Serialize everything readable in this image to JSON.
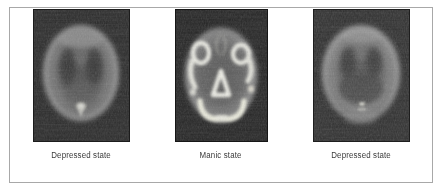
{
  "figure": {
    "type": "pet-brain-scan-series",
    "background_color": "#ffffff",
    "frame_border_color": "#a8a8a8",
    "caption_color": "#3a3a3a",
    "panels": [
      {
        "id": "panel-depressed-left",
        "caption": "Depressed state",
        "scan_label": "depressed-state-scan-left",
        "modality": "PET",
        "view": "axial",
        "overall_intensity": "low",
        "bright_spot": "small midline posterior focus",
        "background_color": "#262626",
        "brain_rim_color": "#9a9a9a",
        "interior_color": "#3c3c3c",
        "hotspot_color": "#e8e8e2"
      },
      {
        "id": "panel-manic",
        "caption": "Manic state",
        "scan_label": "manic-state-scan",
        "modality": "PET",
        "view": "axial",
        "overall_intensity": "high",
        "bright_spot": "multiple bright cortical and midline foci",
        "background_color": "#1f1f1f",
        "brain_rim_color": "#8d8d8d",
        "interior_color": "#454545",
        "hotspot_color": "#f2f2ec"
      },
      {
        "id": "panel-depressed-right",
        "caption": "Depressed state",
        "scan_label": "depressed-state-scan-right",
        "modality": "PET",
        "view": "axial",
        "overall_intensity": "low",
        "bright_spot": "faint midline posterior focus",
        "background_color": "#2b2b2b",
        "brain_rim_color": "#a2a2a2",
        "interior_color": "#3f3f3f",
        "hotspot_color": "#ddddd6"
      }
    ]
  }
}
